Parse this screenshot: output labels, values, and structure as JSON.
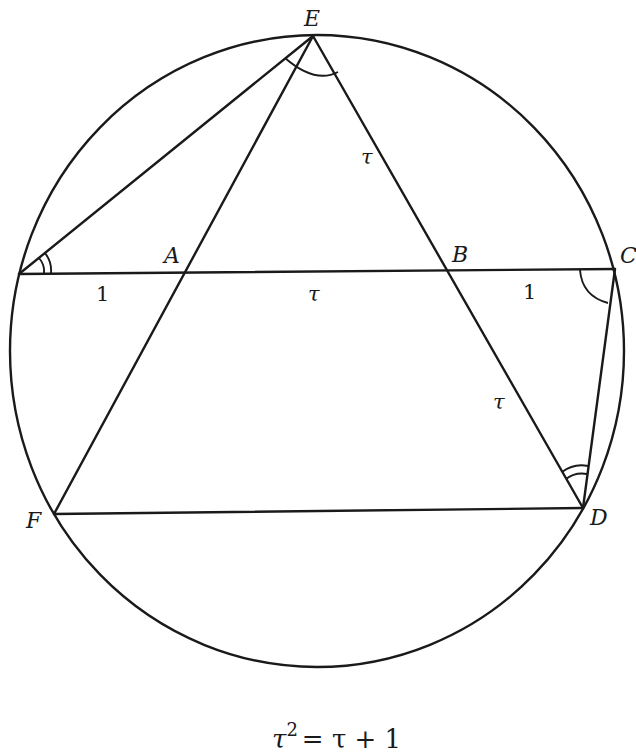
{
  "diagram": {
    "points": {
      "E": {
        "label": "E",
        "x": 313,
        "y": 36
      },
      "L": {
        "label": "",
        "x": 19,
        "y": 274
      },
      "A": {
        "label": "A",
        "x": 184,
        "y": 271
      },
      "B": {
        "label": "B",
        "x": 449,
        "y": 270
      },
      "C": {
        "label": "C",
        "x": 615,
        "y": 269
      },
      "D": {
        "label": "D",
        "x": 583,
        "y": 508
      },
      "F": {
        "label": "F",
        "x": 54,
        "y": 514
      }
    },
    "segment_labels": {
      "LA": "1",
      "AB": "τ",
      "BC": "1",
      "EB": "τ",
      "BD": "τ"
    },
    "circle": {
      "cx": 317,
      "cy": 351,
      "rx": 307,
      "ry": 316
    },
    "equation": {
      "base": "τ",
      "exponent": "2",
      "rhs": "= τ + 1"
    }
  }
}
